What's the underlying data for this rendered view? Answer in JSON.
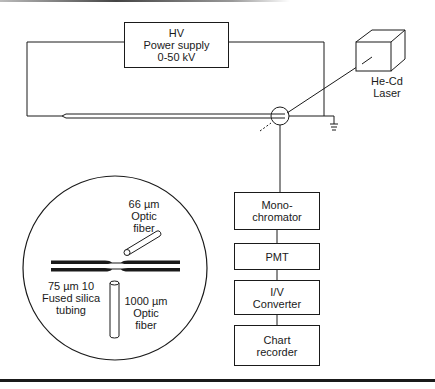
{
  "diagram": {
    "type": "schematic"
  },
  "components": {
    "hv_supply": {
      "lines": [
        "HV",
        "Power supply",
        "0-50 kV"
      ]
    },
    "laser": {
      "lines": [
        "He-Cd",
        "Laser"
      ]
    },
    "monochromator": {
      "lines": [
        "Mono-",
        "chromator"
      ]
    },
    "pmt": {
      "lines": [
        "PMT"
      ]
    },
    "iv_converter": {
      "lines": [
        "I/V",
        "Converter"
      ]
    },
    "chart_recorder": {
      "lines": [
        "Chart",
        "recorder"
      ]
    }
  },
  "inset": {
    "fiber_66": {
      "lines": [
        "66 µm",
        "Optic",
        "fiber"
      ]
    },
    "tubing": {
      "lines": [
        "75 µm 10",
        "Fused silica",
        "tubing"
      ]
    },
    "fiber_1000": {
      "lines": [
        "1000 µm",
        "Optic",
        "fiber"
      ]
    }
  },
  "colors": {
    "line": "#1a1a1a",
    "background": "#ffffff"
  }
}
